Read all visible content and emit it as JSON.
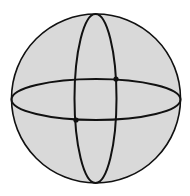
{
  "diagram": {
    "type": "sphere-with-great-circles",
    "colors": {
      "background": "#ffffff",
      "sphere_fill": "#d9d9d9",
      "stroke": "#111111"
    },
    "sphere": {
      "cx": 96,
      "cy": 98.5,
      "r": 84.5
    },
    "meridian": {
      "cx": 95.5,
      "cy": 98.5,
      "rx": 21,
      "ry": 84.5
    },
    "equator": {
      "cx": 96,
      "cy": 99.5,
      "rx": 84.5,
      "ry": 20.5
    },
    "points": [
      {
        "name": "intersection-back",
        "x": 116,
        "y": 79
      },
      {
        "name": "intersection-front",
        "x": 76,
        "y": 120
      }
    ]
  }
}
